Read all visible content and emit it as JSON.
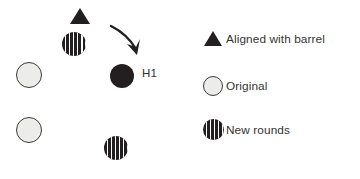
{
  "diagram": {
    "annotation_label": "H1",
    "arrow": {
      "name": "curved-arrow",
      "direction": "down-right"
    },
    "shapes": [
      {
        "id": "aligned-triangle",
        "type": "triangle",
        "meaning": "Aligned with barrel",
        "x": 70,
        "y": 8
      },
      {
        "id": "new-round-top",
        "type": "hatched-circle",
        "meaning": "New rounds",
        "x": 62,
        "y": 32,
        "size": 24
      },
      {
        "id": "original-left-upper",
        "type": "light-circle",
        "meaning": "Original",
        "x": 16,
        "y": 62,
        "size": 26
      },
      {
        "id": "hit-h1",
        "type": "solid-circle",
        "meaning": "H1",
        "x": 110,
        "y": 64,
        "size": 24
      },
      {
        "id": "original-left-lower",
        "type": "light-circle",
        "meaning": "Original",
        "x": 16,
        "y": 117,
        "size": 26
      },
      {
        "id": "new-round-right",
        "type": "hatched-circle",
        "meaning": "New rounds",
        "x": 104,
        "y": 112,
        "size": 24
      },
      {
        "id": "new-round-bottom",
        "type": "hatched-circle",
        "meaning": "New rounds",
        "x": 62,
        "y": 142,
        "size": 24
      }
    ]
  },
  "legend": {
    "items": [
      {
        "marker": "triangle-marker",
        "label": "Aligned with barrel"
      },
      {
        "marker": "light-circle-marker",
        "label": "Original"
      },
      {
        "marker": "hatched-circle-marker",
        "label": "New rounds"
      }
    ]
  },
  "colors": {
    "ink": "#231f20",
    "text": "#333333",
    "original_fill": "#ececeb",
    "background": "#ffffff"
  }
}
